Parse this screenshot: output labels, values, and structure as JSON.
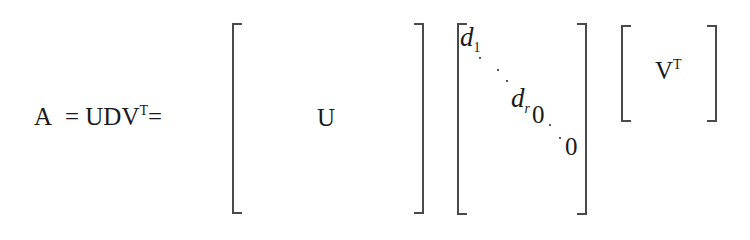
{
  "equation": {
    "lhs": "A",
    "eq1": "=",
    "product": "UDV",
    "product_sup": "T",
    "eq2": "="
  },
  "matrices": {
    "u": {
      "label": "U"
    },
    "d": {
      "d1": "d",
      "d1_sub": "1",
      "dr": "d",
      "dr_sub": "r",
      "zero1": "0",
      "zero2": "0"
    },
    "vt": {
      "label": "V",
      "label_sup": "T"
    }
  }
}
